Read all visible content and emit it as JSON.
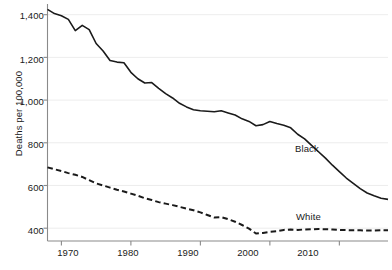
{
  "chart_data": {
    "type": "line",
    "title": "",
    "subtitle": "",
    "xlabel": "",
    "ylabel": "Deaths per 100,000",
    "xlim": [
      1968,
      2017
    ],
    "ylim": [
      340,
      1450
    ],
    "grid": true,
    "grid_axis": "y",
    "legend_position": "inline-right",
    "x_ticks": [
      "1970",
      "1980",
      "1990",
      "2000",
      "2010"
    ],
    "x_tick_values": [
      1970,
      1980,
      1990,
      2000,
      2010
    ],
    "y_ticks": [
      "400",
      "600",
      "800",
      "1,000",
      "1,200",
      "1,400"
    ],
    "y_tick_values": [
      400,
      600,
      800,
      1000,
      1200,
      1400
    ],
    "x": [
      1968,
      1969,
      1970,
      1971,
      1972,
      1973,
      1974,
      1975,
      1976,
      1977,
      1978,
      1979,
      1980,
      1981,
      1982,
      1983,
      1984,
      1985,
      1986,
      1987,
      1988,
      1989,
      1990,
      1991,
      1992,
      1993,
      1994,
      1995,
      1996,
      1997,
      1998,
      1999,
      2000,
      2001,
      2002,
      2003,
      2004,
      2005,
      2006,
      2007,
      2008,
      2009,
      2010,
      2011,
      2012,
      2013,
      2014,
      2015,
      2016,
      2017
    ],
    "series": [
      {
        "name": "Black",
        "label": "Black",
        "style": "solid",
        "color": "#1a1a1a",
        "values": [
          1425,
          1405,
          1395,
          1378,
          1325,
          1350,
          1330,
          1265,
          1230,
          1185,
          1178,
          1175,
          1130,
          1100,
          1080,
          1082,
          1055,
          1030,
          1010,
          985,
          968,
          955,
          950,
          948,
          945,
          950,
          940,
          930,
          912,
          900,
          880,
          885,
          900,
          890,
          882,
          870,
          840,
          818,
          788,
          758,
          728,
          695,
          665,
          635,
          610,
          585,
          565,
          552,
          540,
          535
        ]
      },
      {
        "name": "White",
        "label": "White",
        "style": "dashed",
        "color": "#1a1a1a",
        "values": [
          685,
          676,
          668,
          658,
          650,
          640,
          625,
          610,
          600,
          590,
          580,
          572,
          562,
          552,
          540,
          532,
          522,
          515,
          508,
          500,
          492,
          484,
          474,
          462,
          450,
          452,
          442,
          430,
          415,
          398,
          375,
          378,
          383,
          386,
          392,
          394,
          392,
          394,
          395,
          396,
          395,
          394,
          392,
          391,
          390,
          390,
          389,
          389,
          390,
          390
        ]
      }
    ],
    "annotations": [
      {
        "text": "Black",
        "x": 2003,
        "y": 760
      },
      {
        "text": "White",
        "x": 2003,
        "y": 470
      }
    ]
  }
}
